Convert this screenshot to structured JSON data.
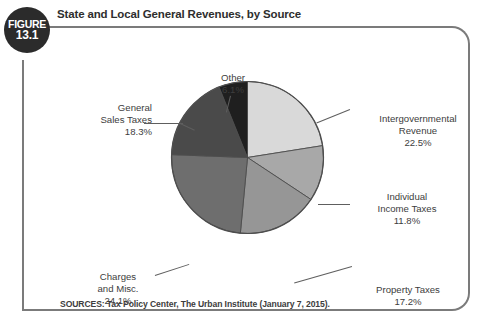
{
  "figure": {
    "badge_word": "FIGURE",
    "badge_number": "13.1",
    "title": "State and Local General Revenues, by Source",
    "source_note": "SOURCES: Tax Policy Center, The Urban Institute (January 7, 2015)."
  },
  "labels": {
    "other": {
      "name": "Other",
      "value": "6.1%"
    },
    "general": {
      "name_line1": "General",
      "name_line2": "Sales Taxes",
      "value": "18.3%"
    },
    "intergov": {
      "name_line1": "Intergovernmental",
      "name_line2": "Revenue",
      "value": "22.5%"
    },
    "individual": {
      "name_line1": "Individual",
      "name_line2": "Income Taxes",
      "value": "11.8%"
    },
    "property": {
      "name": "Property Taxes",
      "value": "17.2%"
    },
    "charges": {
      "name_line1": "Charges",
      "name_line2": "and Misc.",
      "value": "24.1%"
    }
  },
  "chart_data": {
    "type": "pie",
    "title": "State and Local General Revenues, by Source",
    "subtitle": "",
    "unit": "percent",
    "total": 100.0,
    "legend_position": "callout-labels",
    "grid": false,
    "start_angle_deg": 0,
    "direction": "clockwise",
    "categories": [
      "Intergovernmental Revenue",
      "Individual Income Taxes",
      "Property Taxes",
      "Charges and Misc.",
      "General Sales Taxes",
      "Other"
    ],
    "values": [
      22.5,
      11.8,
      17.2,
      24.1,
      18.3,
      6.1
    ],
    "colors": [
      "#d9d9d9",
      "#a8a8a8",
      "#969696",
      "#6e6e6e",
      "#4a4a4a",
      "#1f1f1f"
    ],
    "slice_border_color": "#4d4d4d",
    "slices": [
      {
        "label": "Intergovernmental Revenue",
        "value": 22.5,
        "color": "#d9d9d9"
      },
      {
        "label": "Individual Income Taxes",
        "value": 11.8,
        "color": "#a8a8a8"
      },
      {
        "label": "Property Taxes",
        "value": 17.2,
        "color": "#969696"
      },
      {
        "label": "Charges and Misc.",
        "value": 24.1,
        "color": "#6e6e6e"
      },
      {
        "label": "General Sales Taxes",
        "value": 18.3,
        "color": "#4a4a4a"
      },
      {
        "label": "Other",
        "value": 6.1,
        "color": "#1f1f1f"
      }
    ],
    "source": "SOURCES: Tax Policy Center, The Urban Institute (January 7, 2015)."
  },
  "theme": {
    "frame_border": "#7b7b7b",
    "badge_bg": "#2b2b2b",
    "badge_fg": "#ffffff",
    "text": "#3d3d3d",
    "leader_line": "#5e5e5e",
    "background": "#ffffff"
  }
}
